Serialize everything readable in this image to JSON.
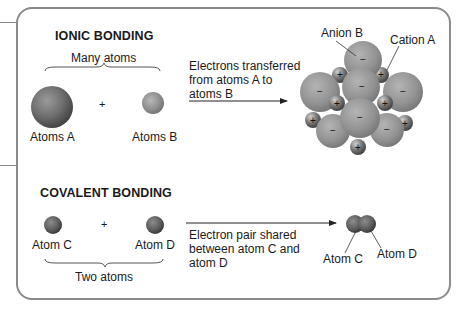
{
  "ionic": {
    "title": "IONIC BONDING",
    "group_label": "Many atoms",
    "atom_a_label": "Atoms A",
    "atom_b_label": "Atoms B",
    "plus": "+",
    "process_line1": "Electrons transferred",
    "process_line2": "from atoms A to",
    "process_line3": "atoms B",
    "anion_label": "Anion B",
    "cation_label": "Cation A",
    "anion_sign": "−",
    "cation_sign": "+"
  },
  "covalent": {
    "title": "COVALENT BONDING",
    "atom_c_label": "Atom C",
    "atom_d_label": "Atom D",
    "plus": "+",
    "group_label": "Two atoms",
    "process_line1": "Electron pair shared",
    "process_line2": "between atom C and",
    "process_line3": "atom D",
    "product_c_label": "Atom C",
    "product_d_label": "Atom D"
  },
  "colors": {
    "frame": "#8a8a8a",
    "sphere_light": "#bdbdbd",
    "sphere_dark": "#5a5a5a",
    "text": "#1a1a1a"
  }
}
